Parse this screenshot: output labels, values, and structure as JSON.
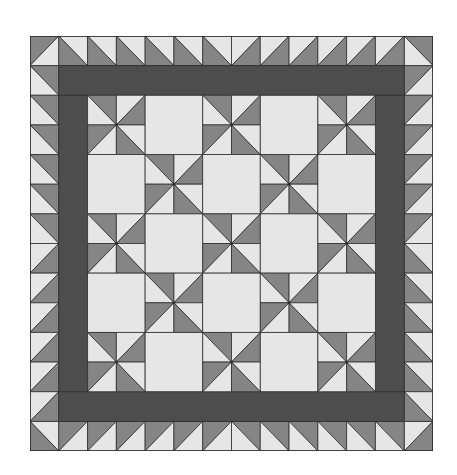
{
  "diagram": {
    "title": "Pinwheel quilt pattern with sawtooth border",
    "grid_cells": 14,
    "colors": {
      "light": "#e6e6e6",
      "medium": "#858585",
      "dark": "#4d4d4d",
      "line": "#2e2e2e",
      "background": "#ffffff"
    },
    "layout": {
      "outer_border": "sawtooth half-square triangles, 1 cell wide",
      "sashing": "solid dark band, 1 cell wide",
      "interior_blocks": "5x5 alternating pinwheel and plain light blocks, each 2x2 cells"
    },
    "interior": {
      "block_rows": 5,
      "block_cols": 5,
      "pattern": [
        [
          "pinwheel",
          "plain",
          "pinwheel",
          "plain",
          "pinwheel"
        ],
        [
          "plain",
          "pinwheel",
          "plain",
          "pinwheel",
          "plain"
        ],
        [
          "pinwheel",
          "plain",
          "pinwheel",
          "plain",
          "pinwheel"
        ],
        [
          "plain",
          "pinwheel",
          "plain",
          "pinwheel",
          "plain"
        ],
        [
          "pinwheel",
          "plain",
          "pinwheel",
          "plain",
          "pinwheel"
        ]
      ]
    }
  }
}
